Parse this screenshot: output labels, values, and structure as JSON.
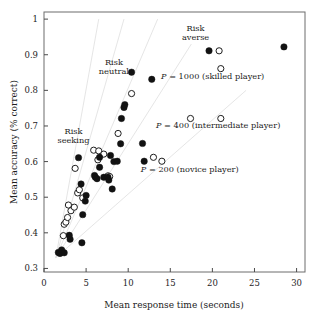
{
  "chart_data": {
    "type": "scatter",
    "title": "",
    "xlabel": "Mean response time (seconds)",
    "ylabel": "Mean accuracy (% correct)",
    "xlim": [
      0,
      31
    ],
    "ylim": [
      0.29,
      1.02
    ],
    "xticks": [
      0,
      5,
      10,
      15,
      20,
      25,
      30
    ],
    "xticklabels": [
      "0",
      "5",
      "10",
      "15",
      "20",
      "25",
      "30"
    ],
    "yticks": [
      0.3,
      0.4,
      0.5,
      0.6,
      0.7,
      0.8,
      0.9,
      1
    ],
    "yticklabels": [
      "0.3",
      "0.4",
      "0.5",
      "0.6",
      "0.7",
      "0.8",
      "0.9",
      "1"
    ],
    "grid": false,
    "legend": "none",
    "series": [
      {
        "name": "filled",
        "marker": "filled-circle",
        "color": "#121212",
        "points": [
          [
            1.7,
            0.345
          ],
          [
            1.9,
            0.342
          ],
          [
            2.1,
            0.352
          ],
          [
            2.4,
            0.344
          ],
          [
            3.0,
            0.393
          ],
          [
            3.1,
            0.382
          ],
          [
            4.5,
            0.372
          ],
          [
            4.6,
            0.451
          ],
          [
            4.9,
            0.489
          ],
          [
            5.0,
            0.505
          ],
          [
            4.4,
            0.537
          ],
          [
            4.1,
            0.611
          ],
          [
            6.0,
            0.561
          ],
          [
            6.1,
            0.556
          ],
          [
            6.3,
            0.552
          ],
          [
            6.6,
            0.584
          ],
          [
            6.6,
            0.612
          ],
          [
            7.1,
            0.556
          ],
          [
            7.6,
            0.556
          ],
          [
            7.7,
            0.548
          ],
          [
            7.9,
            0.617
          ],
          [
            8.1,
            0.523
          ],
          [
            8.3,
            0.6
          ],
          [
            8.7,
            0.601
          ],
          [
            9.1,
            0.65
          ],
          [
            9.2,
            0.721
          ],
          [
            9.5,
            0.752
          ],
          [
            9.6,
            0.76
          ],
          [
            10.4,
            0.851
          ],
          [
            11.7,
            0.651
          ],
          [
            11.9,
            0.601
          ],
          [
            12.8,
            0.831
          ],
          [
            19.6,
            0.911
          ],
          [
            28.5,
            0.922
          ]
        ]
      },
      {
        "name": "open",
        "marker": "open-circle",
        "color": "#ffffff",
        "points": [
          [
            2.3,
            0.392
          ],
          [
            2.4,
            0.424
          ],
          [
            2.6,
            0.43
          ],
          [
            2.8,
            0.443
          ],
          [
            2.9,
            0.478
          ],
          [
            3.2,
            0.462
          ],
          [
            3.6,
            0.472
          ],
          [
            4.0,
            0.512
          ],
          [
            4.2,
            0.521
          ],
          [
            4.6,
            0.498
          ],
          [
            3.7,
            0.581
          ],
          [
            5.9,
            0.632
          ],
          [
            6.5,
            0.63
          ],
          [
            6.4,
            0.605
          ],
          [
            7.1,
            0.621
          ],
          [
            7.6,
            0.56
          ],
          [
            7.8,
            0.558
          ],
          [
            8.8,
            0.679
          ],
          [
            10.4,
            0.791
          ],
          [
            13.0,
            0.612
          ],
          [
            14.0,
            0.601
          ],
          [
            17.4,
            0.721
          ],
          [
            21.0,
            0.721
          ],
          [
            20.8,
            0.911
          ],
          [
            21.0,
            0.861
          ]
        ]
      }
    ],
    "annotations": [
      {
        "id": "risk-seeking",
        "lines": [
          "Risk",
          "seeking"
        ],
        "x": 3.5,
        "y": 0.678
      },
      {
        "id": "risk-neutral",
        "lines": [
          "Risk",
          "neutral"
        ],
        "x": 8.3,
        "y": 0.872
      },
      {
        "id": "risk-averse",
        "lines": [
          "Risk",
          "averse"
        ],
        "x": 18.0,
        "y": 0.968
      },
      {
        "id": "p-1000",
        "text_italic": "P",
        "text": " = 1000 (skilled player)",
        "x": 13.9,
        "y": 0.833
      },
      {
        "id": "p-400",
        "text_italic": "P",
        "text": " = 400 (intermediate player)",
        "x": 13.3,
        "y": 0.695
      },
      {
        "id": "p-200",
        "text_italic": "P",
        "text": " = 200 (novice player)",
        "x": 11.5,
        "y": 0.572
      }
    ]
  }
}
